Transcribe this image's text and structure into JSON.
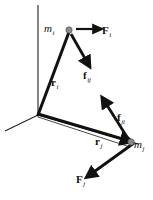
{
  "figure": {
    "background_color": "#ffffff",
    "stroke_color": "#111111",
    "particle_color": "#8a8a8a",
    "axis_color": "#222222",
    "width": 153,
    "height": 200
  },
  "axes": {
    "name": "coordinate-frame",
    "origin": {
      "x": 38,
      "y": 115
    },
    "lines": [
      {
        "name": "axis-vertical",
        "x1": 38,
        "y1": 115,
        "x2": 38,
        "y2": 5
      },
      {
        "name": "axis-left",
        "x1": 38,
        "y1": 115,
        "x2": 5,
        "y2": 131
      },
      {
        "name": "axis-right",
        "x1": 38,
        "y1": 115,
        "x2": 138,
        "y2": 144
      }
    ]
  },
  "particles": [
    {
      "id": "mi",
      "label": "m",
      "subscript": "i",
      "x": 69,
      "y": 30,
      "radius": 3.2
    },
    {
      "id": "mj",
      "label": "m",
      "subscript": "j",
      "x": 131,
      "y": 142,
      "radius": 3.2
    }
  ],
  "vectors": [
    {
      "id": "r_i",
      "label": "r",
      "subscript": "i",
      "bold": true,
      "from": {
        "x": 38,
        "y": 115
      },
      "to": {
        "x": 69,
        "y": 32
      },
      "style": "thick",
      "arrowhead": false,
      "description": "position vector from origin to particle m sub i"
    },
    {
      "id": "r_j",
      "label": "r",
      "subscript": "j",
      "bold": true,
      "from": {
        "x": 38,
        "y": 115
      },
      "to": {
        "x": 128,
        "y": 141
      },
      "style": "thick",
      "arrowhead": true,
      "description": "position vector from origin to particle m sub j"
    },
    {
      "id": "F_i",
      "label": "F",
      "subscript": "i",
      "bold": true,
      "from": {
        "x": 75,
        "y": 29
      },
      "to": {
        "x": 99,
        "y": 29
      },
      "style": "medium",
      "arrowhead": true,
      "description": "external force on particle i, pointing right"
    },
    {
      "id": "f_ij",
      "label": "f",
      "subscript": "ij",
      "bold": true,
      "from": {
        "x": 71,
        "y": 33
      },
      "to": {
        "x": 88,
        "y": 63
      },
      "style": "thick",
      "arrowhead": true,
      "description": "internal force on particle i from particle j, pointing down-right"
    },
    {
      "id": "f_ji",
      "label": "f",
      "subscript": "ji",
      "bold": true,
      "from": {
        "x": 128,
        "y": 138
      },
      "to": {
        "x": 104,
        "y": 100
      },
      "style": "thick",
      "arrowhead": true,
      "description": "internal force on particle j from particle i, pointing up-left"
    },
    {
      "id": "F_j",
      "label": "F",
      "subscript": "j",
      "bold": true,
      "from": {
        "x": 133,
        "y": 143
      },
      "to": {
        "x": 89,
        "y": 175
      },
      "style": "thick",
      "arrowhead": true,
      "description": "external force on particle j, pointing down-left"
    }
  ],
  "thin_line": {
    "name": "separation-line",
    "from": {
      "x": 38,
      "y": 117
    },
    "to": {
      "x": 130,
      "y": 147
    }
  },
  "labels": {
    "mi": {
      "base": "m",
      "sub": "i"
    },
    "mj": {
      "base": "m",
      "sub": "j"
    },
    "Fi": {
      "base": "F",
      "sub": "i"
    },
    "Fj": {
      "base": "F",
      "sub": "j"
    },
    "fij": {
      "base": "f",
      "sub": "ij"
    },
    "fji": {
      "base": "f",
      "sub": "ji"
    },
    "ri": {
      "base": "r",
      "sub": "i"
    },
    "rj": {
      "base": "r",
      "sub": "j"
    }
  }
}
